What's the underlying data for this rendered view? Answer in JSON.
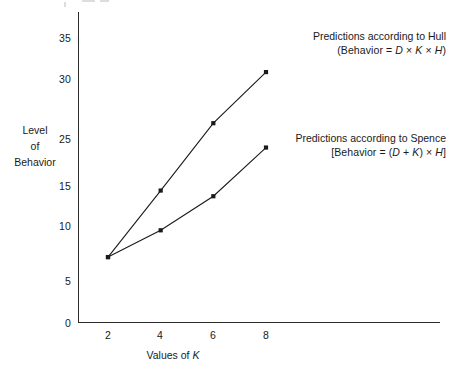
{
  "chart_data": {
    "type": "line",
    "title": "",
    "xlabel": "Values of K",
    "ylabel": "Level of Behavior",
    "ylabel_lines": [
      "Level",
      "of",
      "Behavior"
    ],
    "x": [
      2,
      4,
      6,
      8
    ],
    "xlim": [
      0,
      10
    ],
    "ylim": [
      0,
      37
    ],
    "grid": false,
    "legend_position": "inline-annotations",
    "xticks": [
      "2",
      "4",
      "6",
      "8"
    ],
    "xtick_values": [
      2,
      4,
      6,
      8
    ],
    "yticks": [
      "0",
      "5",
      "10",
      "15",
      "25",
      "30",
      "35"
    ],
    "ytick_values": [
      0,
      5,
      10,
      15,
      25,
      30,
      35
    ],
    "series": [
      {
        "name": "Predictions according to Hull",
        "values": [
          8,
          16.2,
          24.5,
          30.8
        ],
        "marker": "square",
        "color": "#1a1a1a"
      },
      {
        "name": "Predictions according to Spence",
        "values": [
          8,
          11.3,
          15.5,
          21.5
        ],
        "marker": "square",
        "color": "#1a1a1a"
      }
    ],
    "annotations": [
      {
        "id": "hull",
        "line1": "Predictions according to Hull",
        "formula_parts": [
          "(Behavior = ",
          "D",
          " × ",
          "K",
          " × ",
          "H",
          ")"
        ]
      },
      {
        "id": "spence",
        "line1": "Predictions according to Spence",
        "formula_parts": [
          "[Behavior = (",
          "D",
          " + ",
          "K",
          ") × ",
          "H",
          "]"
        ]
      }
    ]
  },
  "annotations": {
    "hull": {
      "title": "Predictions according to Hull",
      "formula_open": "(Behavior = ",
      "formula_var1": "D",
      "formula_op1": " × ",
      "formula_var2": "K",
      "formula_op2": " × ",
      "formula_var3": "H",
      "formula_close": ")"
    },
    "spence": {
      "title": "Predictions according to Spence",
      "formula_open": "[Behavior = (",
      "formula_var1": "D",
      "formula_op1": " + ",
      "formula_var2": "K",
      "formula_op2": ") × ",
      "formula_var3": "H",
      "formula_close": "]"
    }
  },
  "axes": {
    "y_title_line1": "Level",
    "y_title_line2": "of",
    "y_title_line3": "Behavior",
    "x_title_prefix": "Values of ",
    "x_title_var": "K"
  }
}
